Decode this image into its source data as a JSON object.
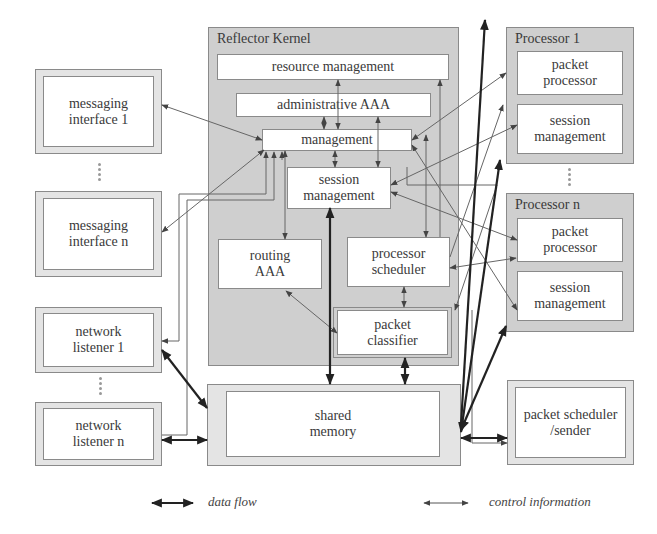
{
  "kernel": {
    "title": "Reflector Kernel",
    "resource_management": "resource management",
    "administrative_aaa": "administrative AAA",
    "management": "management",
    "session_management_l1": "session",
    "session_management_l2": "management",
    "routing_aaa_l1": "routing",
    "routing_aaa_l2": "AAA",
    "processor_scheduler_l1": "processor",
    "processor_scheduler_l2": "scheduler",
    "packet_classifier_l1": "packet",
    "packet_classifier_l2": "classifier"
  },
  "left": {
    "messaging_1_l1": "messaging",
    "messaging_1_l2": "interface 1",
    "messaging_n_l1": "messaging",
    "messaging_n_l2": "interface n",
    "listener_1_l1": "network",
    "listener_1_l2": "listener 1",
    "listener_n_l1": "network",
    "listener_n_l2": "listener n"
  },
  "processors": [
    {
      "title": "Processor 1",
      "packet_l1": "packet",
      "packet_l2": "processor",
      "session_l1": "session",
      "session_l2": "management"
    },
    {
      "title": "Processor n",
      "packet_l1": "packet",
      "packet_l2": "processor",
      "session_l1": "session",
      "session_l2": "management"
    }
  ],
  "bottom": {
    "shared_memory_l1": "shared",
    "shared_memory_l2": "memory",
    "sender_l1": "packet scheduler",
    "sender_l2": "/sender"
  },
  "legend": {
    "data_flow": "data flow",
    "control_information": "control information"
  },
  "colors": {
    "frame_fill": "#cfcfcf",
    "box_fill": "#ffffff",
    "line": "#555555",
    "data_line": "#222222"
  }
}
